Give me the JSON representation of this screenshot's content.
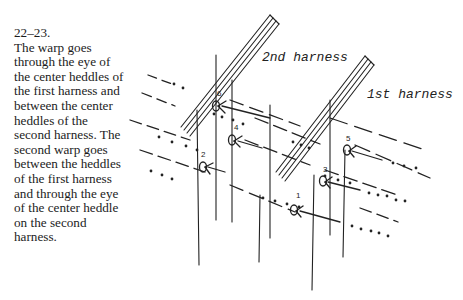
{
  "figure": {
    "number": "22–23.",
    "caption": "The warp goes through the eye of the center heddles of the first harness and between the center heddles of the second harness. The second warp goes between the heddles of the first harness and through the eye of the center heddle on the second harness."
  },
  "diagram": {
    "labels": {
      "second_harness": "2nd harness",
      "first_harness": "1st harness"
    },
    "heddle_numbers": [
      "1",
      "2",
      "3",
      "4",
      "5",
      "6"
    ],
    "ink_color": "#222222"
  }
}
